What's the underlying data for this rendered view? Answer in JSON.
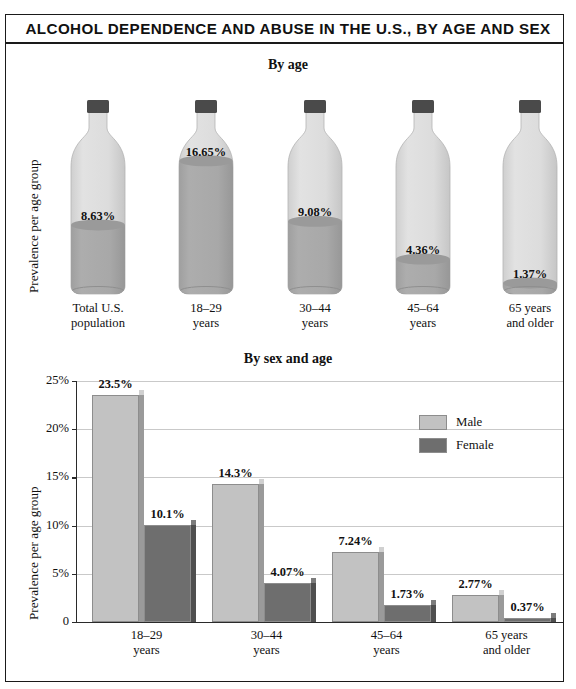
{
  "title": "ALCOHOL DEPENDENCE AND ABUSE IN THE U.S., BY AGE AND SEX",
  "colors": {
    "light": "#bdbdbd",
    "light_fill": "#d6d6d6",
    "dark": "#8c8c8c",
    "glass": "#dadada",
    "liquid": "#a6a6a6",
    "cap": "#4a4a4a",
    "male": "#c2c2c2",
    "female": "#6e6e6e",
    "grid": "#c9c9c9",
    "axis": "#2a2a2a",
    "text": "#111111"
  },
  "chart_data": [
    {
      "type": "bar",
      "title": "By age",
      "style": "bottle-pictogram",
      "xlabel": "",
      "ylabel": "Prevalence per age group",
      "categories": [
        "Total U.S. population",
        "18–29 years",
        "30–44 years",
        "45–64 years",
        "65 years and older"
      ],
      "category_lines": [
        [
          "Total U.S.",
          "population"
        ],
        [
          "18–29",
          "years"
        ],
        [
          "30–44",
          "years"
        ],
        [
          "45–64",
          "years"
        ],
        [
          "65 years",
          "and older"
        ]
      ],
      "values": [
        8.63,
        16.65,
        9.08,
        4.36,
        1.37
      ],
      "value_labels": [
        "8.63%",
        "16.65%",
        "9.08%",
        "4.36%",
        "1.37%"
      ],
      "ylim": [
        0,
        18
      ],
      "grid": false,
      "legend": null
    },
    {
      "type": "bar",
      "title": "By sex and age",
      "xlabel": "",
      "ylabel": "Prevalence per age group",
      "categories": [
        "18–29 years",
        "30–44 years",
        "45–64 years",
        "65 years and older"
      ],
      "category_lines": [
        [
          "18–29",
          "years"
        ],
        [
          "30–44",
          "years"
        ],
        [
          "45–64",
          "years"
        ],
        [
          "65 years",
          "and older"
        ]
      ],
      "series": [
        {
          "name": "Male",
          "values": [
            23.5,
            14.3,
            7.24,
            2.77
          ],
          "value_labels": [
            "23.5%",
            "14.3%",
            "7.24%",
            "2.77%"
          ],
          "color": "#c2c2c2"
        },
        {
          "name": "Female",
          "values": [
            10.1,
            4.07,
            1.73,
            0.37
          ],
          "value_labels": [
            "10.1%",
            "4.07%",
            "1.73%",
            "0.37%"
          ],
          "color": "#6e6e6e"
        }
      ],
      "ylim": [
        0,
        25
      ],
      "yticks": [
        0,
        5,
        10,
        15,
        20,
        25
      ],
      "ytick_labels": [
        "0",
        "5%",
        "10%",
        "15%",
        "20%",
        "25%"
      ],
      "grid": true,
      "legend": {
        "position": "upper-right",
        "entries": [
          "Male",
          "Female"
        ]
      }
    }
  ]
}
